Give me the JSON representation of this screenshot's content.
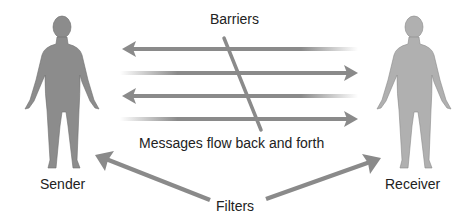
{
  "diagram": {
    "labels": {
      "barriers": "Barriers",
      "messages": "Messages flow back and forth",
      "sender": "Sender",
      "receiver": "Receiver",
      "filters": "Filters"
    },
    "colors": {
      "sender_figure": "#8c8c8c",
      "receiver_figure": "#b0b0b0",
      "arrow": "#8a8a8a",
      "text": "#222222"
    },
    "message_arrows": [
      {
        "direction": "left",
        "y": 49
      },
      {
        "direction": "right",
        "y": 73
      },
      {
        "direction": "left",
        "y": 96
      },
      {
        "direction": "right",
        "y": 119
      }
    ]
  }
}
